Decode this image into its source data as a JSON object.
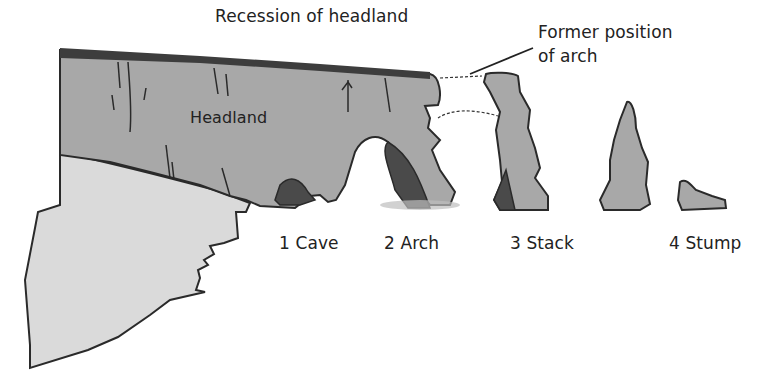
{
  "diagram": {
    "title": "Recession of headland",
    "labels": {
      "headland": "Headland",
      "former_arch_line1": "Former position",
      "former_arch_line2": "of arch"
    },
    "stages": [
      {
        "number": "1",
        "name": "Cave",
        "label": "1 Cave"
      },
      {
        "number": "2",
        "name": "Arch",
        "label": "2 Arch"
      },
      {
        "number": "3",
        "name": "Stack",
        "label": "3 Stack"
      },
      {
        "number": "4",
        "name": "Stump",
        "label": "4 Stump"
      }
    ],
    "colors": {
      "headland_fill": "#a9a9a9",
      "cliff_fill": "#d9d9d9",
      "cave_fill": "#4a4a4a",
      "top_band": "#3d3d3d",
      "outline": "#2a2a2a",
      "shadow": "#bdbdbd"
    }
  }
}
